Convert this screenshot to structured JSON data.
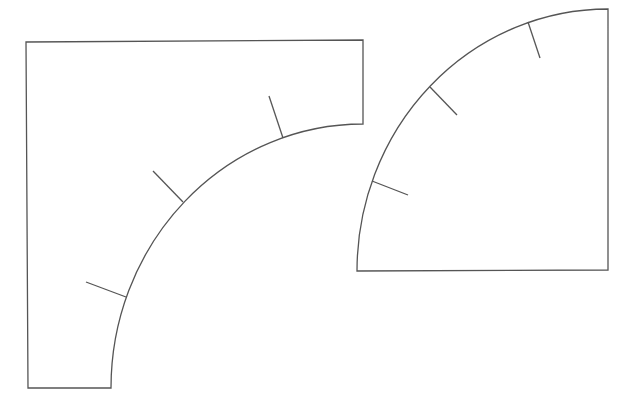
{
  "canvas": {
    "width": 637,
    "height": 407,
    "background": "#ffffff"
  },
  "style": {
    "stroke_color": "#555555",
    "stroke_width": 1.3
  },
  "shapes": [
    {
      "name": "rectangle-with-concave-quarter-arc",
      "outline_path": "M 28 388 L 26 42 L 363 40 L 363 124 A 252 264 0 0 0 111 388 Z",
      "ticks": [
        {
          "x1": 283,
          "y1": 138,
          "x2": 269,
          "y2": 96
        },
        {
          "x1": 183,
          "y1": 202,
          "x2": 153,
          "y2": 171
        },
        {
          "x1": 126,
          "y1": 297,
          "x2": 86,
          "y2": 282
        }
      ]
    },
    {
      "name": "quarter-circle-sector",
      "outline_path": "M 357 271 A 251 262 0 0 1 608 9 L 608 270 Z",
      "ticks": [
        {
          "x1": 528,
          "y1": 22,
          "x2": 540,
          "y2": 58
        },
        {
          "x1": 430,
          "y1": 87,
          "x2": 457,
          "y2": 115
        },
        {
          "x1": 372,
          "y1": 181,
          "x2": 408,
          "y2": 195
        }
      ]
    }
  ]
}
